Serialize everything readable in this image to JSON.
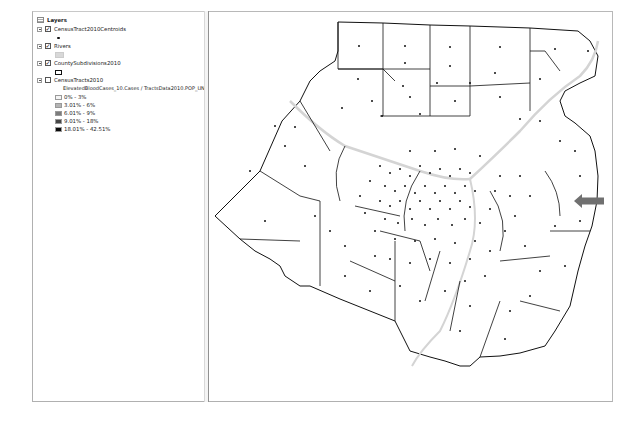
{
  "toc": {
    "root_label": "Layers",
    "layers": [
      {
        "name": "CensusTract2010Centroids",
        "checked": true,
        "symbol": "point"
      },
      {
        "name": "Rivers",
        "checked": true,
        "symbol": "river-line"
      },
      {
        "name": "CountySubdivisions2010",
        "checked": true,
        "symbol": "polygon-outline"
      },
      {
        "name": "CensusTracts2010",
        "checked": false,
        "symbol": "graduated",
        "field_label": "ElevatedBloodCases_10.Cases / TractsData2010.POP_UNDR18",
        "classes": [
          {
            "label": "0% - 3%",
            "color": "#f4f4f4"
          },
          {
            "label": "3.01% - 6%",
            "color": "#b4b4b4"
          },
          {
            "label": "6.01% - 9%",
            "color": "#7c7c7c"
          },
          {
            "label": "9.01% - 18%",
            "color": "#454545"
          },
          {
            "label": "18.01% - 42.51%",
            "color": "#0a0a0a"
          }
        ]
      }
    ]
  },
  "map": {
    "highlight_arrow_color": "#707070",
    "boundary_color": "#111111",
    "river_color": "#d0d0d0",
    "centroid_color": "#111111"
  }
}
